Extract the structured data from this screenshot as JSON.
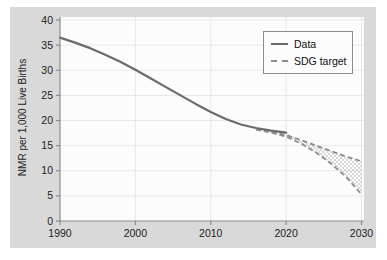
{
  "style": {
    "page_bg": "#ffffff",
    "panel_bg": "#d9d9d9",
    "plot_bg": "#fcfcfc",
    "grid_color": "#e8e8e8",
    "spine_color": "#8c8c8c",
    "tick_label_color": "#222222",
    "data_line_color": "#6b6b6b",
    "sdg_line_color": "#8c8c8c",
    "stipple_color": "#999999",
    "legend_border_color": "#8c8c8c",
    "legend_bg": "#fcfcfc"
  },
  "chart_data": {
    "type": "line",
    "title": "",
    "xlabel": "",
    "ylabel": "NMR per 1,000 Live Births",
    "xlim": [
      1990,
      2030
    ],
    "ylim": [
      0,
      40
    ],
    "x_ticks": [
      1990,
      2000,
      2010,
      2020,
      2030
    ],
    "y_ticks": [
      0,
      5,
      10,
      15,
      20,
      25,
      30,
      35,
      40
    ],
    "grid": true,
    "legend_position": "top-right",
    "series": [
      {
        "name": "Data",
        "line_style": "solid",
        "x": [
          1990,
          1992,
          1994,
          1996,
          1998,
          2000,
          2002,
          2004,
          2006,
          2008,
          2010,
          2012,
          2014,
          2016,
          2018,
          2020
        ],
        "y": [
          36.5,
          35.5,
          34.4,
          33.1,
          31.7,
          30.1,
          28.4,
          26.7,
          25.0,
          23.3,
          21.7,
          20.3,
          19.2,
          18.5,
          18.0,
          17.6
        ]
      },
      {
        "name": "SDG target",
        "line_style": "dashed",
        "band_fill": "stipple",
        "x": [
          2016,
          2018,
          2020,
          2022,
          2024,
          2026,
          2028,
          2030
        ],
        "upper": [
          18.3,
          17.8,
          17.1,
          16.1,
          15.0,
          13.9,
          12.8,
          11.9
        ],
        "lower": [
          18.2,
          17.6,
          16.8,
          15.4,
          13.6,
          11.4,
          8.7,
          5.3
        ]
      }
    ]
  }
}
